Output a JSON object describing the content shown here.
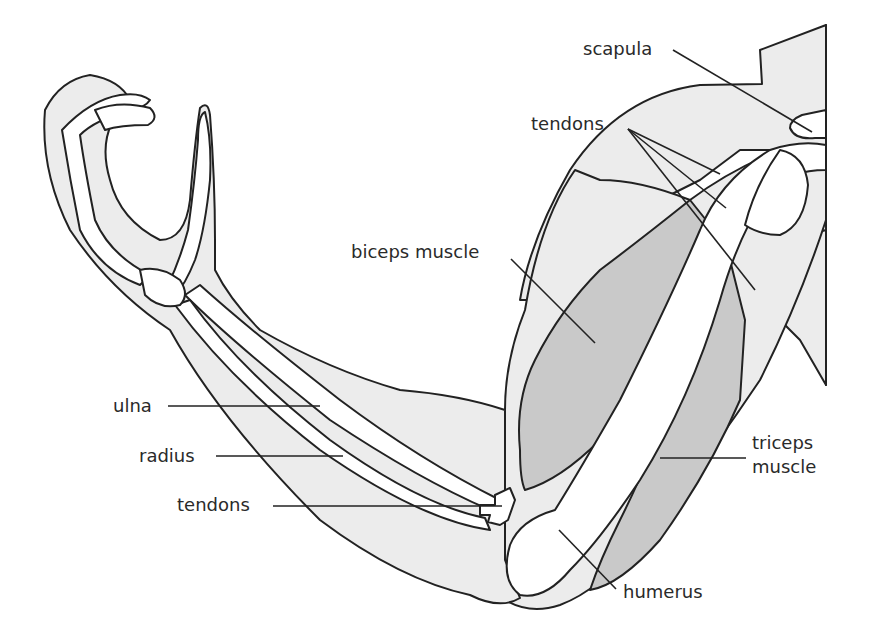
{
  "diagram": {
    "colors": {
      "skin": "#ececec",
      "muscle": "#c9c9c9",
      "bone": "#ffffff",
      "line": "#222222",
      "text": "#2a2a2a"
    },
    "labels": {
      "scapula": "scapula",
      "tendons_top": "tendons",
      "biceps": "biceps muscle",
      "ulna": "ulna",
      "radius": "radius",
      "tendons_bottom": "tendons",
      "triceps_line1": "triceps",
      "triceps_line2": "muscle",
      "humerus": "humerus"
    }
  }
}
